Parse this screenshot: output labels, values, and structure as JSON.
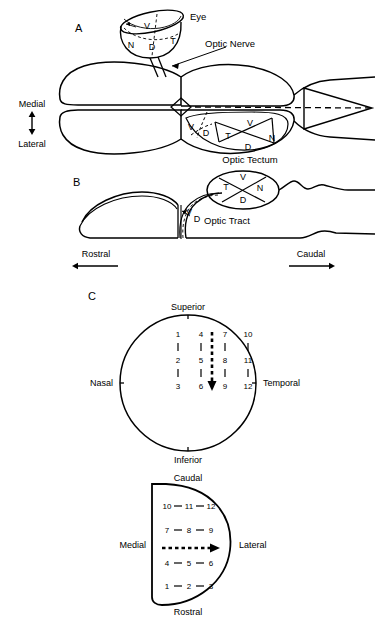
{
  "figure": {
    "panels": [
      {
        "id": "A",
        "letter": "A",
        "view": "dorsal"
      },
      {
        "id": "B",
        "letter": "B",
        "view": "lateral"
      },
      {
        "id": "C",
        "letter": "C",
        "view": "retinotopic-map"
      }
    ]
  },
  "panel_a": {
    "letter": "A",
    "eye_label": "Eye",
    "optic_nerve_label": "Optic Nerve",
    "optic_tectum_label": "Optic Tectum",
    "eye_quadrants": {
      "dorsal": "D",
      "ventral": "V",
      "nasal": "N",
      "temporal": "T"
    },
    "tectum_quadrants": {
      "ventral": "V",
      "dorsal": "D",
      "temporal": "T",
      "nasal": "N"
    },
    "tectum_edge_quadrants": {
      "ventral": "V",
      "dorsal": "D"
    },
    "axis": {
      "top": "Medial",
      "bottom": "Lateral"
    }
  },
  "panel_b": {
    "letter": "B",
    "optic_tract_label": "Optic Tract",
    "tectum_quadrants": {
      "temporal": "T",
      "ventral": "V",
      "nasal": "N",
      "dorsal": "D"
    },
    "tract_quadrants": {
      "ventral": "V",
      "dorsal": "D"
    },
    "axis": {
      "left": "Rostral",
      "right": "Caudal"
    }
  },
  "panel_c": {
    "letter": "C",
    "retina": {
      "top_label": "Superior",
      "bottom_label": "Inferior",
      "left_label": "Nasal",
      "right_label": "Temporal",
      "columns": [
        [
          "1",
          "2",
          "3"
        ],
        [
          "4",
          "5",
          "6"
        ],
        [
          "7",
          "8",
          "9"
        ],
        [
          "10",
          "11",
          "12"
        ]
      ],
      "arrow_direction": "down"
    },
    "tectum": {
      "top_label": "Caudal",
      "bottom_label": "Rostral",
      "left_label": "Medial",
      "right_label": "Lateral",
      "rows": [
        [
          "10",
          "11",
          "12"
        ],
        [
          "7",
          "8",
          "9"
        ],
        [
          "4",
          "5",
          "6"
        ],
        [
          "1",
          "2",
          "3"
        ]
      ],
      "arrow_direction": "right"
    }
  },
  "colors": {
    "ink": "#000000",
    "paper": "#ffffff"
  }
}
